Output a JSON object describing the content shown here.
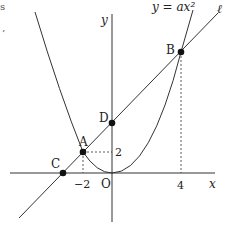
{
  "figure": {
    "type": "coordinate-geometry",
    "curve_label": "y = ax²",
    "line_label": "ℓ",
    "axes": {
      "x_label": "x",
      "y_label": "y",
      "origin_label": "O"
    },
    "points": {
      "A": {
        "label": "A",
        "x": -2,
        "y": 2
      },
      "B": {
        "label": "B",
        "x": 4
      },
      "C": {
        "label": "C"
      },
      "D": {
        "label": "D"
      }
    },
    "ticks": {
      "x_neg2": "−2",
      "x_4": "4",
      "y_2": "2"
    },
    "edge_fragments": {
      "top_left_1": "s",
      "top_left_2": "’"
    }
  },
  "colors": {
    "stroke": "#333333",
    "point": "#111111",
    "background": "#ffffff"
  }
}
